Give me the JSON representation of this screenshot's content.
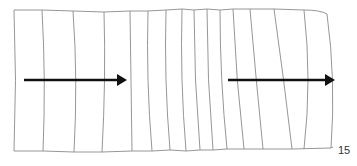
{
  "figure": {
    "page_number": "15",
    "colors": {
      "line": "#8a8a8a",
      "arrow": "#111111",
      "background": "#ffffff"
    },
    "strips_top_x": [
      14,
      42,
      73,
      104,
      130,
      148,
      166,
      182,
      194,
      207,
      220,
      233,
      250,
      274,
      304,
      327
    ],
    "strips_bottom_x": [
      14,
      43,
      74,
      102,
      132,
      152,
      170,
      186,
      200,
      213,
      227,
      244,
      263,
      292,
      331,
      326
    ],
    "arrows": [
      {
        "name": "left-arrow",
        "x1": 24,
        "x2": 126,
        "y": 80
      },
      {
        "name": "right-arrow",
        "x1": 228,
        "x2": 334,
        "y": 80
      }
    ]
  }
}
